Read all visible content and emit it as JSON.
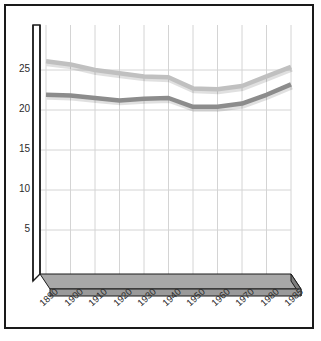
{
  "chart_data": {
    "type": "line",
    "title": "",
    "subtitle": "",
    "xlabel": "",
    "ylabel": "",
    "categories": [
      "1890",
      "1900",
      "1910",
      "1920",
      "1930",
      "1940",
      "1950",
      "1960",
      "1970",
      "1980",
      "1985"
    ],
    "x": [
      1890,
      1900,
      1910,
      1920,
      1930,
      1940,
      1950,
      1960,
      1970,
      1980,
      1985
    ],
    "series": [
      {
        "name": "upper-series",
        "color": "#c0c0c0",
        "values": [
          26.1,
          25.7,
          25.0,
          24.6,
          24.2,
          24.1,
          22.7,
          22.6,
          23.0,
          24.2,
          25.4
        ]
      },
      {
        "name": "lower-series",
        "color": "#8c8c8c",
        "values": [
          21.9,
          21.8,
          21.5,
          21.2,
          21.4,
          21.5,
          20.4,
          20.4,
          20.8,
          21.9,
          23.2
        ]
      }
    ],
    "ylim": [
      0,
      27.5
    ],
    "yticks": [
      5,
      10,
      15,
      20,
      25
    ],
    "ytick_labels": [
      "5",
      "10",
      "15",
      "20",
      "25"
    ],
    "grid": true,
    "grid_x": true,
    "grid_y": true,
    "legend": "none",
    "style_3d": true,
    "annotations": []
  },
  "style": {
    "frame_color": "#1a1a1a",
    "axis_color": "#1a1a1a",
    "grid_color": "#d4d4d4",
    "floor_fill": "#a8a8a8",
    "floor_edge": "#1a1a1a",
    "background": "#ffffff",
    "tick_text_color": "#2b2b2b"
  }
}
